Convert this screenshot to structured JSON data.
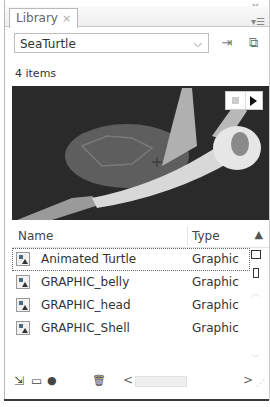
{
  "window": {
    "minimize_glyph": "–",
    "close_glyph": "×"
  },
  "tab": {
    "label": "Library",
    "close_glyph": "×"
  },
  "panel_menu_glyph": "▾☰",
  "library_select": {
    "value": "SeaTurtle",
    "chevron_glyph": "⌄"
  },
  "toolbar": {
    "pin_glyph": "⇥",
    "new_library_glyph": "⧉"
  },
  "item_count": "4 items",
  "preview": {
    "stop_label": "stop",
    "play_label": "play",
    "colors": {
      "background": "#2a2a2a",
      "shell": "#6a6a6a",
      "body": "#a8a8a8",
      "highlight": "#e8e8e8"
    }
  },
  "columns": {
    "name": "Name",
    "type": "Type",
    "sort_glyph": "▲"
  },
  "items": [
    {
      "name": "Animated Turtle",
      "type": "Graphic",
      "selected": true
    },
    {
      "name": "GRAPHIC_belly",
      "type": "Graphic",
      "selected": false
    },
    {
      "name": "GRAPHIC_head",
      "type": "Graphic",
      "selected": false
    },
    {
      "name": "GRAPHIC_Shell",
      "type": "Graphic",
      "selected": false
    }
  ],
  "scroll": {
    "up_glyph": "︿",
    "down_glyph": "﹀",
    "left_glyph": "<",
    "right_glyph": ">"
  },
  "footer": {
    "new_symbol_glyph": "⇲",
    "new_folder_glyph": "▭",
    "properties_glyph": "●",
    "delete_glyph": "🗑"
  }
}
